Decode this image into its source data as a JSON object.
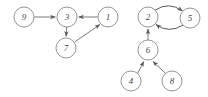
{
  "diagram": {
    "width": 208,
    "height": 97,
    "background_color": "#ffffff",
    "node_stroke_color": "#8a8a8a",
    "node_fill_color": "#ffffff",
    "edge_color": "#6e6e6e",
    "label_color": "#4a4a4a",
    "node_radius": 10,
    "components": 2
  },
  "nodes": [
    {
      "id": "9",
      "label": "9",
      "cx": 24,
      "cy": 17,
      "r": 10,
      "component": "left"
    },
    {
      "id": "3",
      "label": "3",
      "cx": 67,
      "cy": 17,
      "r": 10,
      "component": "left"
    },
    {
      "id": "1",
      "label": "1",
      "cx": 108,
      "cy": 17,
      "r": 10,
      "component": "left"
    },
    {
      "id": "7",
      "label": "7",
      "cx": 66,
      "cy": 48,
      "r": 10,
      "component": "left"
    },
    {
      "id": "2",
      "label": "2",
      "cx": 148,
      "cy": 17,
      "r": 10,
      "component": "right"
    },
    {
      "id": "5",
      "label": "5",
      "cx": 190,
      "cy": 18,
      "r": 10,
      "component": "right"
    },
    {
      "id": "6",
      "label": "6",
      "cx": 148,
      "cy": 50,
      "r": 10,
      "component": "right"
    },
    {
      "id": "4",
      "label": "4",
      "cx": 131,
      "cy": 81,
      "r": 10,
      "component": "right"
    },
    {
      "id": "8",
      "label": "8",
      "cx": 172,
      "cy": 81,
      "r": 10,
      "component": "right"
    }
  ],
  "edges": [
    {
      "from": "9",
      "to": "3",
      "style": "straight",
      "directed": true
    },
    {
      "from": "1",
      "to": "3",
      "style": "straight",
      "directed": true
    },
    {
      "from": "3",
      "to": "7",
      "style": "straight",
      "directed": true
    },
    {
      "from": "7",
      "to": "1",
      "style": "straight",
      "directed": true
    },
    {
      "from": "2",
      "to": "5",
      "style": "curved-top",
      "directed": true
    },
    {
      "from": "5",
      "to": "2",
      "style": "curved-bottom",
      "directed": true
    },
    {
      "from": "6",
      "to": "2",
      "style": "straight",
      "directed": true
    },
    {
      "from": "4",
      "to": "6",
      "style": "straight",
      "directed": true
    },
    {
      "from": "8",
      "to": "6",
      "style": "straight",
      "directed": true
    }
  ]
}
